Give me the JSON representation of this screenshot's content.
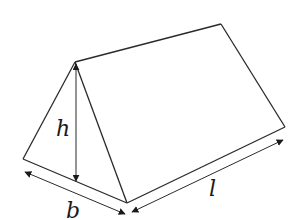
{
  "diagram": {
    "type": "triangular-prism",
    "labels": {
      "height": "h",
      "base": "b",
      "length": "l"
    },
    "colors": {
      "stroke": "#2a2a2a",
      "background": "#ffffff"
    }
  }
}
